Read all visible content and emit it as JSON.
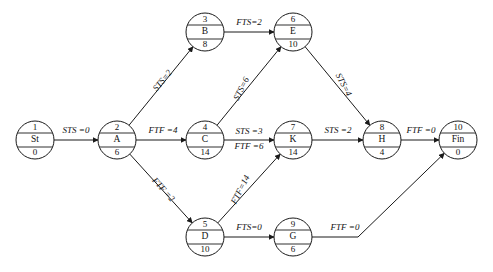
{
  "diagram": {
    "type": "activity-network-precedence-diagram",
    "nodes": [
      {
        "id": "st",
        "num": "1",
        "label": "St",
        "duration": "0",
        "cx": 35,
        "cy": 140
      },
      {
        "id": "a",
        "num": "2",
        "label": "A",
        "duration": "6",
        "cx": 117,
        "cy": 140
      },
      {
        "id": "b",
        "num": "3",
        "label": "B",
        "duration": "8",
        "cx": 205,
        "cy": 32
      },
      {
        "id": "c",
        "num": "4",
        "label": "C",
        "duration": "14",
        "cx": 205,
        "cy": 140
      },
      {
        "id": "d",
        "num": "5",
        "label": "D",
        "duration": "10",
        "cx": 205,
        "cy": 237
      },
      {
        "id": "e",
        "num": "6",
        "label": "E",
        "duration": "10",
        "cx": 293,
        "cy": 32
      },
      {
        "id": "k",
        "num": "7",
        "label": "K",
        "duration": "14",
        "cx": 293,
        "cy": 140
      },
      {
        "id": "g",
        "num": "9",
        "label": "G",
        "duration": "6",
        "cx": 293,
        "cy": 237
      },
      {
        "id": "h",
        "num": "8",
        "label": "H",
        "duration": "4",
        "cx": 382,
        "cy": 140
      },
      {
        "id": "fin",
        "num": "10",
        "label": "Fin",
        "duration": "0",
        "cx": 458,
        "cy": 140
      }
    ],
    "edges": [
      {
        "id": "st-a",
        "from": "st",
        "to": "a",
        "label": "STS =0",
        "label_x": 76,
        "label_y": 131,
        "rotate": 0
      },
      {
        "id": "a-b",
        "from": "a",
        "to": "b",
        "label": "STS=2",
        "label_x": 163,
        "label_y": 81,
        "rotate": -51
      },
      {
        "id": "a-c",
        "from": "a",
        "to": "c",
        "label": "FTF =4",
        "label_x": 163,
        "label_y": 131,
        "rotate": 0
      },
      {
        "id": "a-d",
        "from": "a",
        "to": "d",
        "label": "FTF =2",
        "label_x": 163,
        "label_y": 190,
        "rotate": 48
      },
      {
        "id": "b-e",
        "from": "b",
        "to": "e",
        "label": "FTS=2",
        "label_x": 249,
        "label_y": 23,
        "rotate": 0
      },
      {
        "id": "c-e",
        "from": "c",
        "to": "e",
        "label": "STS=6",
        "label_x": 242,
        "label_y": 89,
        "rotate": -63
      },
      {
        "id": "c-k-1",
        "from": "c",
        "to": "k",
        "label": "STS =3",
        "label_x": 249,
        "label_y": 132,
        "rotate": 0
      },
      {
        "id": "c-k-2",
        "from": "c",
        "to": "k",
        "label": "FTF =6",
        "label_x": 249,
        "label_y": 147,
        "rotate": 0
      },
      {
        "id": "d-k",
        "from": "d",
        "to": "k",
        "label": "FTF=14",
        "label_x": 241,
        "label_y": 190,
        "rotate": -63
      },
      {
        "id": "d-g",
        "from": "d",
        "to": "g",
        "label": "FTS=0",
        "label_x": 249,
        "label_y": 228,
        "rotate": 0
      },
      {
        "id": "e-h",
        "from": "e",
        "to": "h",
        "label": "STS=4",
        "label_x": 343,
        "label_y": 85,
        "rotate": 63
      },
      {
        "id": "k-h",
        "from": "k",
        "to": "h",
        "label": "STS =2",
        "label_x": 338,
        "label_y": 131,
        "rotate": 0
      },
      {
        "id": "h-fin",
        "from": "h",
        "to": "fin",
        "label": "FTF =0",
        "label_x": 421,
        "label_y": 131,
        "rotate": 0
      },
      {
        "id": "g-fin",
        "from": "g",
        "to": "fin",
        "label": "FTF =0",
        "label_x": 345,
        "label_y": 228,
        "rotate": 0
      }
    ],
    "colors": {
      "stroke": "#1a1a1a",
      "background": "#ffffff",
      "text": "#111111"
    }
  }
}
